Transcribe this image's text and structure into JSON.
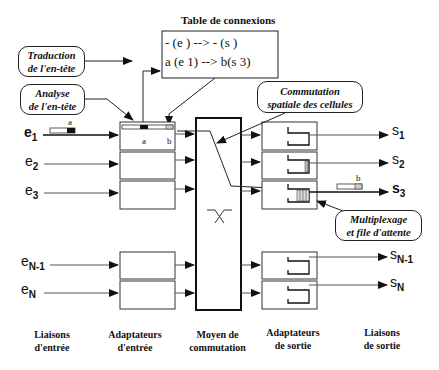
{
  "title": "Table de connexions",
  "table": {
    "rows": [
      "- (e   ) --> - (s   )",
      "a (e 1) --> b(s 3)"
    ]
  },
  "callouts": {
    "traduction": [
      "Traduction",
      "de l'en-tête"
    ],
    "analyse": [
      "Analyse",
      "de l'en-tête"
    ],
    "commutation": [
      "Commutation",
      "spatiale des cellules"
    ],
    "multiplexage": [
      "Multiplexage",
      "et file d'attente"
    ]
  },
  "inputs": [
    {
      "base": "e",
      "sub": "1"
    },
    {
      "base": "e",
      "sub": "2"
    },
    {
      "base": "e",
      "sub": "3"
    },
    {
      "base": "e",
      "sub": "N-1"
    },
    {
      "base": "e",
      "sub": "N"
    }
  ],
  "outputs": [
    {
      "base": "s",
      "sub": "1"
    },
    {
      "base": "s",
      "sub": "2"
    },
    {
      "base": "s",
      "sub": "3"
    },
    {
      "base": "s",
      "sub": "N-1"
    },
    {
      "base": "s",
      "sub": "N"
    }
  ],
  "cell_labels": {
    "in_cell": "a",
    "adapter_a": "a",
    "adapter_b": "b",
    "out_cell": "b"
  },
  "columns": [
    [
      "Liaisons",
      "d'entrée"
    ],
    [
      "Adaptateurs",
      "d'entrée"
    ],
    [
      "Moyen de",
      "commutation"
    ],
    [
      "Adaptateurs",
      "de sortie"
    ],
    [
      "Liaisons",
      "de sortie"
    ]
  ]
}
